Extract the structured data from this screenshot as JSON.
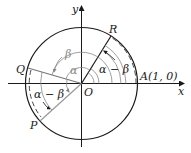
{
  "diagram": {
    "type": "unit-circle-angle-difference",
    "labels": {
      "y_axis": "y",
      "x_axis": "x",
      "origin": "O",
      "point_R": "R",
      "point_Q": "Q",
      "point_P": "P",
      "point_A": "A(1, 0)",
      "angle_alpha": "α",
      "angle_beta": "β",
      "angle_alpha_minus_beta_right": "α − β",
      "angle_alpha_minus_beta_left": "α − β"
    },
    "colors": {
      "stroke": "#1a1a1a",
      "gray": "#888888"
    }
  }
}
